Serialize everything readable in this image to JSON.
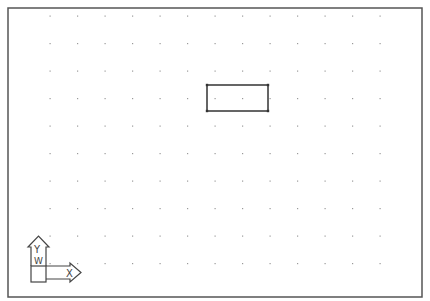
{
  "viewport": {
    "name": "model-space",
    "background": "#ffffff",
    "border_color": "#555555",
    "frame": {
      "x": 8,
      "y": 8,
      "width": 414,
      "height": 289
    }
  },
  "grid": {
    "dot_color": "#9a9a9a",
    "x_start": 50,
    "x_step": 27.5,
    "columns": 13,
    "y_start": 16,
    "y_step": 27.5,
    "rows": 10
  },
  "drawing": {
    "rectangle": {
      "x": 207,
      "y": 85,
      "width": 61,
      "height": 26,
      "stroke": "#333333"
    }
  },
  "ucs_icon": {
    "y_label": "Y",
    "x_label": "X",
    "w_label": "W",
    "color": "#444444"
  }
}
